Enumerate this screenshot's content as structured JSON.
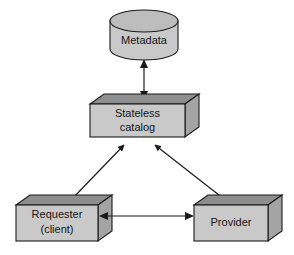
{
  "diagram": {
    "canvas": {
      "width": 294,
      "height": 255,
      "background": "#ffffff"
    },
    "palette": {
      "front_face": "#c9c9c9",
      "top_face": "#8e8e8e",
      "side_face": "#a4a4a4",
      "outline": "#1a1a1a",
      "text": "#141414"
    },
    "nodes": [
      {
        "id": "metadata",
        "shape": "cylinder",
        "label": "Metadata",
        "label_lines": [
          "Metadata"
        ],
        "x": 110,
        "y": 10,
        "width": 68,
        "height": 50
      },
      {
        "id": "stateless-catalog",
        "shape": "box3d",
        "label": "Stateless catalog",
        "label_lines": [
          "Stateless",
          "catalog"
        ],
        "x": 90,
        "y": 98,
        "width": 95,
        "height": 32,
        "depth": 14
      },
      {
        "id": "requester",
        "shape": "box3d",
        "label": "Requester (client)",
        "label_lines": [
          "Requester",
          "(client)"
        ],
        "x": 16,
        "y": 200,
        "width": 82,
        "height": 36,
        "depth": 14
      },
      {
        "id": "provider",
        "shape": "box3d",
        "label": "Provider",
        "label_lines": [
          "Provider"
        ],
        "x": 194,
        "y": 200,
        "width": 74,
        "height": 36,
        "depth": 14
      }
    ],
    "edges": [
      {
        "id": "catalog-metadata",
        "from": "stateless-catalog",
        "to": "metadata",
        "style": "double-arrow",
        "orientation": "vertical"
      },
      {
        "id": "requester-catalog",
        "from": "requester",
        "to": "stateless-catalog",
        "style": "single-arrow",
        "orientation": "diagonal"
      },
      {
        "id": "provider-catalog",
        "from": "provider",
        "to": "stateless-catalog",
        "style": "single-arrow",
        "orientation": "diagonal"
      },
      {
        "id": "requester-provider",
        "from": "requester",
        "to": "provider",
        "style": "double-arrow",
        "orientation": "horizontal"
      }
    ]
  }
}
